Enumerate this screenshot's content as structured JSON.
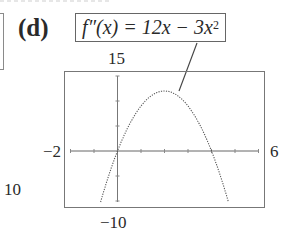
{
  "panel": {
    "label": "(d)",
    "equation": {
      "lhs": "f″(x) = 12x − 3x",
      "exponent": "2"
    },
    "stray_fragment_label": "10"
  },
  "chart_data": {
    "type": "line",
    "function": "12x - 3x^2",
    "xlabel": "",
    "ylabel": "",
    "xlim": [
      -2,
      6
    ],
    "ylim": [
      -10,
      15
    ],
    "x_tick_labels": [
      "-2",
      "6"
    ],
    "y_tick_labels": [
      "15",
      "-10"
    ],
    "x_ticks": [
      -2,
      -1,
      0,
      1,
      2,
      3,
      4,
      5,
      6
    ],
    "y_ticks": [
      -10,
      -5,
      0,
      5,
      10,
      15
    ],
    "grid": false,
    "legend": null,
    "annotation": {
      "text": "f''(x) = 12x - 3x^2",
      "points_to": [
        2,
        12
      ]
    },
    "x": [
      -0.72,
      -0.5,
      0,
      0.5,
      1,
      1.5,
      2,
      2.5,
      3,
      3.5,
      4,
      4.5,
      4.72
    ],
    "series": [
      {
        "name": "f''(x)",
        "values": [
          -10.2,
          -6.75,
          0,
          5.25,
          9,
          11.25,
          12,
          11.25,
          9,
          5.25,
          0,
          -6.75,
          -10.2
        ]
      }
    ],
    "roots": [
      0,
      4
    ],
    "vertex": [
      2,
      12
    ]
  },
  "labels": {
    "ymax": "15",
    "ymin": "−10",
    "xmin": "−2",
    "xmax": "6"
  }
}
